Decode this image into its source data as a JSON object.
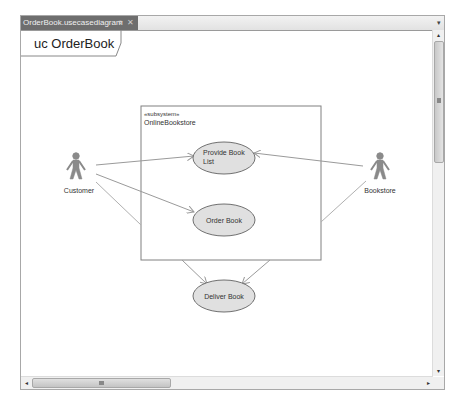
{
  "document_tab": {
    "label": "OrderBook.usecasediagram",
    "pin_icon": "⌖",
    "close_icon": "✕",
    "dropdown_icon": "▾"
  },
  "diagram": {
    "frame_title": "uc OrderBook",
    "subsystem": {
      "stereotype": "«subsystem»",
      "name": "OnlineBookstore"
    },
    "actors": [
      {
        "name": "Customer"
      },
      {
        "name": "Bookstore"
      }
    ],
    "use_cases": [
      {
        "line1": "Provide Book",
        "line2": "List"
      },
      {
        "label": "Order Book"
      },
      {
        "label": "Deliver Book"
      }
    ],
    "colors": {
      "ellipse_fill": "#e0e0e0",
      "ellipse_stroke": "#707070",
      "actor": "#8a8a8a",
      "line": "#9a9a9a",
      "tab_bg": "#6e6e6e"
    }
  },
  "scrollbars": {
    "up": "▴",
    "down": "▾",
    "left": "◂",
    "right": "▸"
  }
}
